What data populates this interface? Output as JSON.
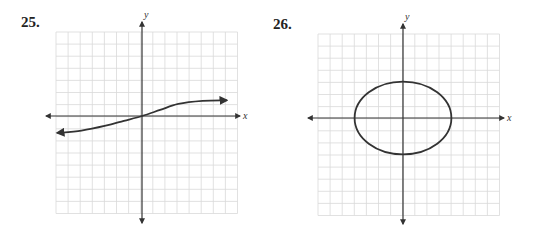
{
  "problems": [
    {
      "number": "25.",
      "description": "Arctan-like increasing curve through origin with horizontal asymptotes"
    },
    {
      "number": "26.",
      "description": "Ellipse centered at origin"
    }
  ],
  "axes": {
    "x_label": "x",
    "y_label": "y"
  },
  "colors": {
    "grid": "#d9d9d9",
    "axis": "#333333",
    "curve": "#333333"
  },
  "chart_data": [
    {
      "type": "line",
      "title": "25.",
      "xlabel": "x",
      "ylabel": "y",
      "grid": true,
      "grid_cells": {
        "x": [
          -7.5,
          7.5
        ],
        "y": [
          -7.5,
          7.5
        ]
      },
      "curve": "s-shaped increasing curve through (0,0), approaching y≈1.3 as x→+∞ and y≈-1.4 as x→-∞, arrows on both ends",
      "points": [
        [
          -7,
          -1.4
        ],
        [
          -5,
          -1.2
        ],
        [
          -3,
          -0.8
        ],
        [
          -1.5,
          -0.4
        ],
        [
          0,
          0
        ],
        [
          1.5,
          0.5
        ],
        [
          3,
          1.0
        ],
        [
          5,
          1.25
        ],
        [
          7,
          1.3
        ]
      ]
    },
    {
      "type": "line",
      "title": "26.",
      "xlabel": "x",
      "ylabel": "y",
      "grid": true,
      "grid_cells": {
        "x": [
          -7.5,
          7.5
        ],
        "y": [
          -7.5,
          7.5
        ]
      },
      "curve": "ellipse centered at origin",
      "center": [
        0,
        0
      ],
      "semi_axis_x": 4,
      "semi_axis_y": 3
    }
  ]
}
